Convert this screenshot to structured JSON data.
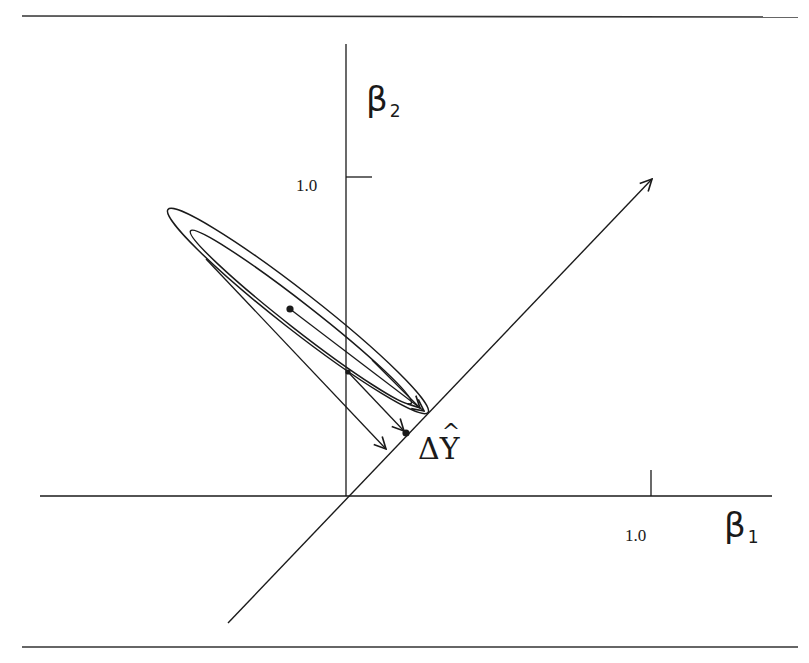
{
  "figure": {
    "type": "geometric regression diagram",
    "axes": {
      "x": {
        "label": "β",
        "subscript": "1",
        "tick_label": "1.0"
      },
      "y": {
        "label": "β",
        "subscript": "2",
        "tick_label": "1.0"
      }
    },
    "annotation": {
      "delta": "Δ",
      "y_letter": "Y",
      "hat": "^"
    },
    "elements": {
      "confidence_ellipses": 2,
      "center_point": "estimate",
      "projection_direction": "diagonal arrow (β1 = β2 direction)",
      "projection_arrows": 3
    },
    "colors": {
      "ink": "#1a1a1a",
      "background": "#ffffff"
    }
  }
}
